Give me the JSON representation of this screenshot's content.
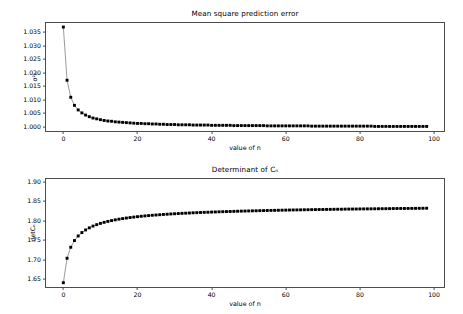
{
  "figure": {
    "background": "#ffffff",
    "line_color": "#808080",
    "marker_color": "#000000",
    "axis_color": "#4c4c4c"
  },
  "chart_data": [
    {
      "type": "line",
      "id": "mean-square-prediction-error",
      "title": "Mean square prediction error",
      "xlabel": "value of n",
      "ylabel": "σ²ₙ",
      "grid": false,
      "legend": null,
      "xlim": [
        -4.95,
        102.95
      ],
      "ylim": [
        0.99813,
        1.03887
      ],
      "xticks": [
        0,
        20,
        40,
        60,
        80,
        100
      ],
      "yticks": [
        1.0,
        1.005,
        1.01,
        1.015,
        1.02,
        1.025,
        1.03,
        1.035
      ],
      "ytick_labels": [
        "1.000",
        "1.005",
        "1.010",
        "1.015",
        "1.020",
        "1.025",
        "1.030",
        "1.035"
      ],
      "xtick_labels": [
        "0",
        "20",
        "40",
        "60",
        "80",
        "100"
      ],
      "x": [
        0,
        1,
        2,
        3,
        4,
        5,
        6,
        7,
        8,
        9,
        10,
        11,
        12,
        13,
        14,
        15,
        16,
        17,
        18,
        19,
        20,
        21,
        22,
        23,
        24,
        25,
        26,
        27,
        28,
        29,
        30,
        31,
        32,
        33,
        34,
        35,
        36,
        37,
        38,
        39,
        40,
        41,
        42,
        43,
        44,
        45,
        46,
        47,
        48,
        49,
        50,
        51,
        52,
        53,
        54,
        55,
        56,
        57,
        58,
        59,
        60,
        61,
        62,
        63,
        64,
        65,
        66,
        67,
        68,
        69,
        70,
        71,
        72,
        73,
        74,
        75,
        76,
        77,
        78,
        79,
        80,
        81,
        82,
        83,
        84,
        85,
        86,
        87,
        88,
        89,
        90,
        91,
        92,
        93,
        94,
        95,
        96,
        97,
        98
      ],
      "y": [
        1.037,
        1.0173,
        1.011,
        1.008,
        1.0063,
        1.0052,
        1.0044,
        1.0038,
        1.0033,
        1.003,
        1.0027,
        1.0024,
        1.0022,
        1.0021,
        1.0019,
        1.0018,
        1.0017,
        1.0016,
        1.0015,
        1.0014,
        1.0013,
        1.0013,
        1.0012,
        1.0012,
        1.0011,
        1.0011,
        1.001,
        1.001,
        1.0009,
        1.0009,
        1.0009,
        1.0008,
        1.0008,
        1.0008,
        1.0008,
        1.0007,
        1.0007,
        1.0007,
        1.0007,
        1.0007,
        1.0006,
        1.0006,
        1.0006,
        1.0006,
        1.0006,
        1.0006,
        1.0005,
        1.0005,
        1.0005,
        1.0005,
        1.0005,
        1.0005,
        1.0005,
        1.0005,
        1.0005,
        1.0004,
        1.0004,
        1.0004,
        1.0004,
        1.0004,
        1.0004,
        1.0004,
        1.0004,
        1.0004,
        1.0004,
        1.0004,
        1.0004,
        1.0003,
        1.0003,
        1.0003,
        1.0003,
        1.0003,
        1.0003,
        1.0003,
        1.0003,
        1.0003,
        1.0003,
        1.0003,
        1.0003,
        1.0003,
        1.0003,
        1.0003,
        1.0003,
        1.0003,
        1.0002,
        1.0002,
        1.0002,
        1.0002,
        1.0002,
        1.0002,
        1.0002,
        1.0002,
        1.0002,
        1.0002,
        1.0002,
        1.0002,
        1.0002,
        1.0002,
        1.0002
      ]
    },
    {
      "type": "line",
      "id": "determinant-of-cn",
      "title": "Determinant of Cₙ",
      "xlabel": "value of n",
      "ylabel": "detCₙ",
      "grid": false,
      "legend": null,
      "xlim": [
        -4.95,
        102.95
      ],
      "ylim": [
        1.6282,
        1.9098
      ],
      "xticks": [
        0,
        20,
        40,
        60,
        80,
        100
      ],
      "yticks": [
        1.65,
        1.7,
        1.75,
        1.8,
        1.85,
        1.9
      ],
      "ytick_labels": [
        "1.65",
        "1.70",
        "1.75",
        "1.80",
        "1.85",
        "1.90"
      ],
      "xtick_labels": [
        "0",
        "20",
        "40",
        "60",
        "80",
        "100"
      ],
      "x": [
        0,
        1,
        2,
        3,
        4,
        5,
        6,
        7,
        8,
        9,
        10,
        11,
        12,
        13,
        14,
        15,
        16,
        17,
        18,
        19,
        20,
        21,
        22,
        23,
        24,
        25,
        26,
        27,
        28,
        29,
        30,
        31,
        32,
        33,
        34,
        35,
        36,
        37,
        38,
        39,
        40,
        41,
        42,
        43,
        44,
        45,
        46,
        47,
        48,
        49,
        50,
        51,
        52,
        53,
        54,
        55,
        56,
        57,
        58,
        59,
        60,
        61,
        62,
        63,
        64,
        65,
        66,
        67,
        68,
        69,
        70,
        71,
        72,
        73,
        74,
        75,
        76,
        77,
        78,
        79,
        80,
        81,
        82,
        83,
        84,
        85,
        86,
        87,
        88,
        89,
        90,
        91,
        92,
        93,
        94,
        95,
        96,
        97,
        98
      ],
      "y": [
        1.6417,
        1.7043,
        1.7325,
        1.7497,
        1.7614,
        1.7701,
        1.7768,
        1.7822,
        1.7867,
        1.7904,
        1.7936,
        1.7963,
        1.7987,
        1.8008,
        1.8027,
        1.8044,
        1.8059,
        1.8073,
        1.8086,
        1.8097,
        1.8108,
        1.8118,
        1.8127,
        1.8136,
        1.8144,
        1.8151,
        1.8158,
        1.8165,
        1.8171,
        1.8177,
        1.8183,
        1.8188,
        1.8193,
        1.8198,
        1.8202,
        1.8207,
        1.8211,
        1.8215,
        1.8219,
        1.8222,
        1.8226,
        1.8229,
        1.8232,
        1.8236,
        1.8239,
        1.8241,
        1.8244,
        1.8247,
        1.825,
        1.8252,
        1.8255,
        1.8257,
        1.8259,
        1.8262,
        1.8264,
        1.8266,
        1.8268,
        1.827,
        1.8272,
        1.8274,
        1.8276,
        1.8278,
        1.828,
        1.8281,
        1.8283,
        1.8285,
        1.8286,
        1.8288,
        1.8289,
        1.8291,
        1.8292,
        1.8294,
        1.8295,
        1.8297,
        1.8298,
        1.8299,
        1.8301,
        1.8302,
        1.8303,
        1.8304,
        1.8306,
        1.8307,
        1.8308,
        1.8309,
        1.831,
        1.8311,
        1.8312,
        1.8313,
        1.8314,
        1.8316,
        1.8317,
        1.8318,
        1.8318,
        1.8319,
        1.832,
        1.8321,
        1.8322,
        1.8323,
        1.8324
      ]
    }
  ]
}
